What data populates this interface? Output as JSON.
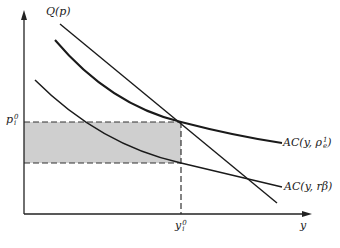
{
  "diagram": {
    "type": "economic-cost-curves",
    "axes": {
      "x_label": "y",
      "y_label": "",
      "origin": [
        24,
        214
      ],
      "x_end": [
        310,
        214
      ],
      "y_end": [
        24,
        10
      ]
    },
    "curves": [
      {
        "name": "Q(p)",
        "label": "Q(p)",
        "kind": "demand-line"
      },
      {
        "name": "AC(y, rho_e^1)",
        "label_main": "AC(y, ρ",
        "label_sup": "1",
        "label_sub": "e",
        "label_close": ")",
        "kind": "average-cost"
      },
      {
        "name": "AC(y, r beta)",
        "label": "AC(y, rβ)",
        "kind": "average-cost"
      }
    ],
    "markers": {
      "p_label_main": "p",
      "p_label_sup": "0",
      "p_label_sub": "i",
      "y_label_main": "y",
      "y_label_sup": "0",
      "y_label_sub": "i"
    },
    "shaded_region": {
      "description": "rectangle between p_i^0 and AC(y_i^0, rβ) up to y_i^0",
      "color": "#cccccc"
    },
    "colors": {
      "line": "#1a1a1a",
      "dashed": "#333333",
      "shade": "#cfcfcf"
    }
  }
}
